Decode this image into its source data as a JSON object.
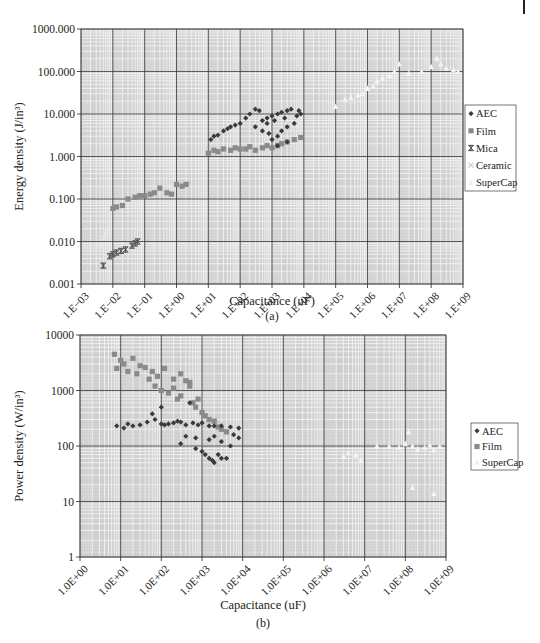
{
  "colors": {
    "plot_bg": "#cfcfcf",
    "grid_minor": "#f2f2f2",
    "grid_major": "#3a3a3a",
    "aec": "#3a3a3a",
    "film": "#8a8a8a",
    "mica": "#555555",
    "ceramic": "#e6e6e6",
    "supercap": "#f4f4f4"
  },
  "chart_data": [
    {
      "id": "a",
      "type": "scatter",
      "caption": "(a)",
      "title": "",
      "xlabel": "Capacitance (uF)",
      "ylabel": "Energy density (J/in³)",
      "xscale": "log",
      "yscale": "log",
      "xlim": [
        0.001,
        1000000000
      ],
      "ylim": [
        0.001,
        1000
      ],
      "grid": true,
      "legend_position": "right",
      "x_tick_labels": [
        "1.E−03",
        "1.E−02",
        "1.E−01",
        "1.E+00",
        "1.E+01",
        "1.E+02",
        "1.E+03",
        "1.E+04",
        "1.E+05",
        "1.E+06",
        "1.E+07",
        "1.E+08",
        "1.E+09"
      ],
      "y_tick_labels": [
        "0.001",
        "0.010",
        "0.100",
        "1.000",
        "10.000",
        "100.000",
        "1000.000"
      ],
      "legend": [
        "AEC",
        "Film",
        "Mica",
        "Ceramic",
        "SuperCap"
      ],
      "series": [
        {
          "name": "AEC",
          "marker": "diamond",
          "points": [
            [
              12,
              2.5
            ],
            [
              15,
              3
            ],
            [
              20,
              3.2
            ],
            [
              30,
              4
            ],
            [
              40,
              4.5
            ],
            [
              50,
              5
            ],
            [
              70,
              5.5
            ],
            [
              100,
              6
            ],
            [
              150,
              8
            ],
            [
              200,
              10
            ],
            [
              300,
              13
            ],
            [
              400,
              12
            ],
            [
              500,
              7
            ],
            [
              700,
              8
            ],
            [
              1000,
              9
            ],
            [
              1500,
              10
            ],
            [
              2000,
              11
            ],
            [
              3000,
              12
            ],
            [
              4000,
              13
            ],
            [
              7000,
              12
            ],
            [
              8000,
              10
            ],
            [
              500,
              4
            ],
            [
              800,
              3.5
            ],
            [
              1000,
              2.5
            ],
            [
              1500,
              3
            ],
            [
              2000,
              4
            ],
            [
              3000,
              5
            ],
            [
              5000,
              6
            ],
            [
              300,
              5
            ],
            [
              700,
              6
            ],
            [
              1200,
              7
            ],
            [
              2500,
              8
            ],
            [
              6000,
              9
            ],
            [
              1500,
              1.8
            ],
            [
              3000,
              2.2
            ]
          ]
        },
        {
          "name": "Film",
          "marker": "square",
          "points": [
            [
              0.01,
              0.06
            ],
            [
              0.013,
              0.065
            ],
            [
              0.02,
              0.07
            ],
            [
              0.03,
              0.1
            ],
            [
              0.05,
              0.11
            ],
            [
              0.07,
              0.12
            ],
            [
              0.1,
              0.12
            ],
            [
              0.15,
              0.13
            ],
            [
              0.2,
              0.14
            ],
            [
              0.3,
              0.18
            ],
            [
              0.5,
              0.14
            ],
            [
              0.7,
              0.13
            ],
            [
              1,
              0.22
            ],
            [
              1.5,
              0.2
            ],
            [
              2,
              0.22
            ],
            [
              10,
              1.2
            ],
            [
              15,
              1.4
            ],
            [
              20,
              1.3
            ],
            [
              30,
              1.5
            ],
            [
              50,
              1.4
            ],
            [
              70,
              1.6
            ],
            [
              100,
              1.5
            ],
            [
              150,
              1.5
            ],
            [
              200,
              1.7
            ],
            [
              300,
              1.4
            ],
            [
              500,
              1.6
            ],
            [
              700,
              1.8
            ],
            [
              1000,
              1.6
            ],
            [
              1500,
              1.8
            ],
            [
              2000,
              2
            ],
            [
              3000,
              2.2
            ],
            [
              5000,
              2.5
            ],
            [
              8000,
              2.8
            ]
          ]
        },
        {
          "name": "Mica",
          "marker": "asterisk",
          "points": [
            [
              0.005,
              0.0027
            ],
            [
              0.008,
              0.0045
            ],
            [
              0.01,
              0.005
            ],
            [
              0.013,
              0.0055
            ],
            [
              0.018,
              0.006
            ],
            [
              0.025,
              0.0065
            ],
            [
              0.04,
              0.008
            ],
            [
              0.05,
              0.009
            ],
            [
              0.06,
              0.01
            ]
          ]
        },
        {
          "name": "Ceramic",
          "marker": "x",
          "points": [
            [
              0.004,
              0.008
            ],
            [
              0.005,
              0.012
            ],
            [
              0.006,
              0.015
            ],
            [
              0.007,
              0.018
            ]
          ]
        },
        {
          "name": "SuperCap",
          "marker": "triangle",
          "points": [
            [
              100000,
              15
            ],
            [
              200000,
              22
            ],
            [
              300000,
              25
            ],
            [
              500000,
              28
            ],
            [
              700000,
              30
            ],
            [
              1000000,
              40
            ],
            [
              1500000,
              45
            ],
            [
              2000000,
              60
            ],
            [
              3000000,
              70
            ],
            [
              5000000,
              80
            ],
            [
              7000000,
              100
            ],
            [
              10000000,
              150
            ],
            [
              20000000,
              90
            ],
            [
              50000000,
              100
            ],
            [
              100000000,
              130
            ],
            [
              150000000,
              200
            ],
            [
              200000000,
              150
            ],
            [
              300000000,
              120
            ],
            [
              500000000,
              110
            ],
            [
              700000000,
              100
            ]
          ]
        }
      ]
    },
    {
      "id": "b",
      "type": "scatter",
      "caption": "(b)",
      "title": "",
      "xlabel": "Capacitance (uF)",
      "ylabel": "Power density (W/in³)",
      "xscale": "log",
      "yscale": "log",
      "xlim": [
        1,
        1000000000
      ],
      "ylim": [
        1,
        10000
      ],
      "grid": true,
      "legend_position": "right",
      "x_tick_labels": [
        "1.0E+00",
        "1.0E+01",
        "1.0E+02",
        "1.0E+03",
        "1.0E+04",
        "1.0E+05",
        "1.0E+06",
        "1.0E+07",
        "1.0E+08",
        "1.0E+09"
      ],
      "y_tick_labels": [
        "1",
        "10",
        "100",
        "1000",
        "10000"
      ],
      "legend": [
        "AEC",
        "Film",
        "SuperCap"
      ],
      "series": [
        {
          "name": "AEC",
          "marker": "diamond",
          "points": [
            [
              8,
              230
            ],
            [
              12,
              210
            ],
            [
              15,
              250
            ],
            [
              20,
              230
            ],
            [
              30,
              240
            ],
            [
              45,
              270
            ],
            [
              60,
              380
            ],
            [
              70,
              300
            ],
            [
              100,
              250
            ],
            [
              120,
              240
            ],
            [
              150,
              250
            ],
            [
              200,
              260
            ],
            [
              250,
              280
            ],
            [
              300,
              270
            ],
            [
              400,
              240
            ],
            [
              500,
              600
            ],
            [
              600,
              260
            ],
            [
              800,
              240
            ],
            [
              1000,
              260
            ],
            [
              1500,
              230
            ],
            [
              2000,
              230
            ],
            [
              3000,
              230
            ],
            [
              5000,
              220
            ],
            [
              8000,
              210
            ],
            [
              400,
              150
            ],
            [
              300,
              110
            ],
            [
              700,
              90
            ],
            [
              1000,
              80
            ],
            [
              1200,
              70
            ],
            [
              1500,
              60
            ],
            [
              1800,
              55
            ],
            [
              2000,
              50
            ],
            [
              3000,
              60
            ],
            [
              2500,
              70
            ],
            [
              4000,
              60
            ],
            [
              1500,
              130
            ],
            [
              2000,
              150
            ],
            [
              3000,
              120
            ],
            [
              5000,
              100
            ],
            [
              700,
              140
            ],
            [
              100,
              500
            ],
            [
              6000,
              160
            ],
            [
              8000,
              140
            ]
          ]
        },
        {
          "name": "Film",
          "marker": "square",
          "points": [
            [
              7,
              4500
            ],
            [
              8,
              2500
            ],
            [
              10,
              3500
            ],
            [
              12,
              3000
            ],
            [
              15,
              2200
            ],
            [
              20,
              3800
            ],
            [
              25,
              2000
            ],
            [
              30,
              2800
            ],
            [
              40,
              2600
            ],
            [
              50,
              1600
            ],
            [
              60,
              2200
            ],
            [
              70,
              1200
            ],
            [
              80,
              1800
            ],
            [
              100,
              1000
            ],
            [
              120,
              2500
            ],
            [
              150,
              900
            ],
            [
              200,
              1100
            ],
            [
              250,
              700
            ],
            [
              300,
              800
            ],
            [
              400,
              1500
            ],
            [
              500,
              1200
            ],
            [
              600,
              600
            ],
            [
              700,
              500
            ],
            [
              800,
              700
            ],
            [
              1000,
              400
            ],
            [
              1200,
              350
            ],
            [
              1500,
              300
            ],
            [
              2000,
              280
            ],
            [
              2500,
              220
            ],
            [
              3000,
              200
            ],
            [
              4000,
              180
            ],
            [
              200,
              1600
            ],
            [
              300,
              2000
            ],
            [
              500,
              1400
            ]
          ]
        },
        {
          "name": "SuperCap",
          "marker": "triangle",
          "points": [
            [
              3000000,
              65
            ],
            [
              4000000,
              75
            ],
            [
              6000000,
              70
            ],
            [
              8000000,
              55
            ],
            [
              20000000,
              100
            ],
            [
              40000000,
              100
            ],
            [
              70000000,
              95
            ],
            [
              100000000,
              110
            ],
            [
              120000000,
              180
            ],
            [
              150000000,
              100
            ],
            [
              200000000,
              90
            ],
            [
              300000000,
              95
            ],
            [
              400000000,
              105
            ],
            [
              500000000,
              85
            ],
            [
              700000000,
              100
            ],
            [
              150000000,
              18
            ],
            [
              500000000,
              14
            ]
          ]
        }
      ]
    }
  ]
}
